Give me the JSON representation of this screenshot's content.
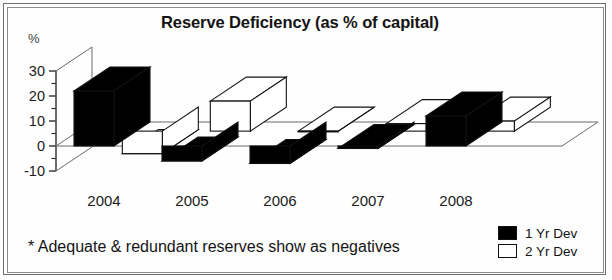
{
  "chart_data": {
    "type": "bar",
    "title": "Reserve Deficiency (as % of capital)",
    "subtitle": "",
    "xlabel": "",
    "ylabel": "%",
    "categories": [
      "2004",
      "2005",
      "2006",
      "2007",
      "2008"
    ],
    "series": [
      {
        "name": "1 Yr Dev",
        "color": "#000000",
        "values": [
          22,
          -6,
          -7,
          -1,
          12
        ]
      },
      {
        "name": "2 Yr Dev",
        "color": "#ffffff",
        "values": [
          -9,
          12,
          0,
          3,
          4
        ]
      }
    ],
    "ylim": [
      -10,
      30
    ],
    "yticks": [
      30,
      20,
      10,
      0,
      -10
    ],
    "yticks_minor": [
      25,
      15,
      5,
      -5
    ],
    "grid": false,
    "legend_position": "bottom-right",
    "three_d": true,
    "annotations": [
      "* Adequate & redundant reserves show as negatives"
    ]
  },
  "title": "Reserve Deficiency (as % of capital)",
  "axis": {
    "unit_label": "%",
    "y_tick_labels": [
      "30",
      "20",
      "10",
      "0",
      "-10"
    ],
    "x_tick_labels": [
      "2004",
      "2005",
      "2006",
      "2007",
      "2008"
    ]
  },
  "legend": {
    "items": [
      {
        "label": "1 Yr Dev",
        "swatch": "#000000"
      },
      {
        "label": "2 Yr Dev",
        "swatch": "#ffffff"
      }
    ]
  },
  "footnote": "* Adequate & redundant reserves show as negatives"
}
